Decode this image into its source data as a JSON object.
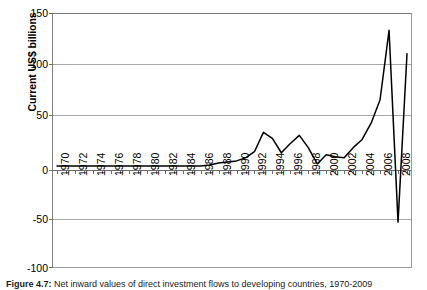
{
  "figure": {
    "caption_label": "Figure 4.7:",
    "caption_text": "Net inward values of direct investment flows to developing countries, 1970-2009"
  },
  "chart_data": {
    "type": "line",
    "title": "",
    "xlabel": "",
    "ylabel": "Current US$ billions",
    "ylim": [
      -100,
      150
    ],
    "yticks": [
      150,
      100,
      50,
      0,
      -50,
      -100
    ],
    "ytick_labels": [
      "150",
      "100",
      "50",
      "0",
      "-50",
      "-100"
    ],
    "xlim": [
      1970,
      2009
    ],
    "xtick_labels": [
      "1970",
      "1972",
      "1974",
      "1976",
      "1978",
      "1980",
      "1982",
      "1984",
      "1986",
      "1988",
      "1990",
      "1992",
      "1994",
      "1996",
      "1998",
      "2000",
      "2002",
      "2004",
      "2006",
      "2008"
    ],
    "grid": "horizontal",
    "legend": "none",
    "series": [
      {
        "name": "Net inward direct investment flows",
        "color": "#000000",
        "x": [
          1970,
          1971,
          1972,
          1973,
          1974,
          1975,
          1976,
          1977,
          1978,
          1979,
          1980,
          1981,
          1982,
          1983,
          1984,
          1985,
          1986,
          1987,
          1988,
          1989,
          1990,
          1991,
          1992,
          1993,
          1994,
          1995,
          1996,
          1997,
          1998,
          1999,
          2000,
          2001,
          2002,
          2003,
          2004,
          2005,
          2006,
          2007,
          2008,
          2009
        ],
        "values": [
          0,
          0,
          0,
          0,
          0,
          0,
          0,
          0,
          0,
          0,
          0,
          0,
          0,
          0,
          0,
          0,
          0,
          1,
          3,
          4,
          5,
          8,
          14,
          33,
          27,
          13,
          22,
          30,
          18,
          2,
          11,
          9,
          8,
          18,
          26,
          42,
          65,
          133,
          -55,
          110
        ]
      }
    ]
  }
}
